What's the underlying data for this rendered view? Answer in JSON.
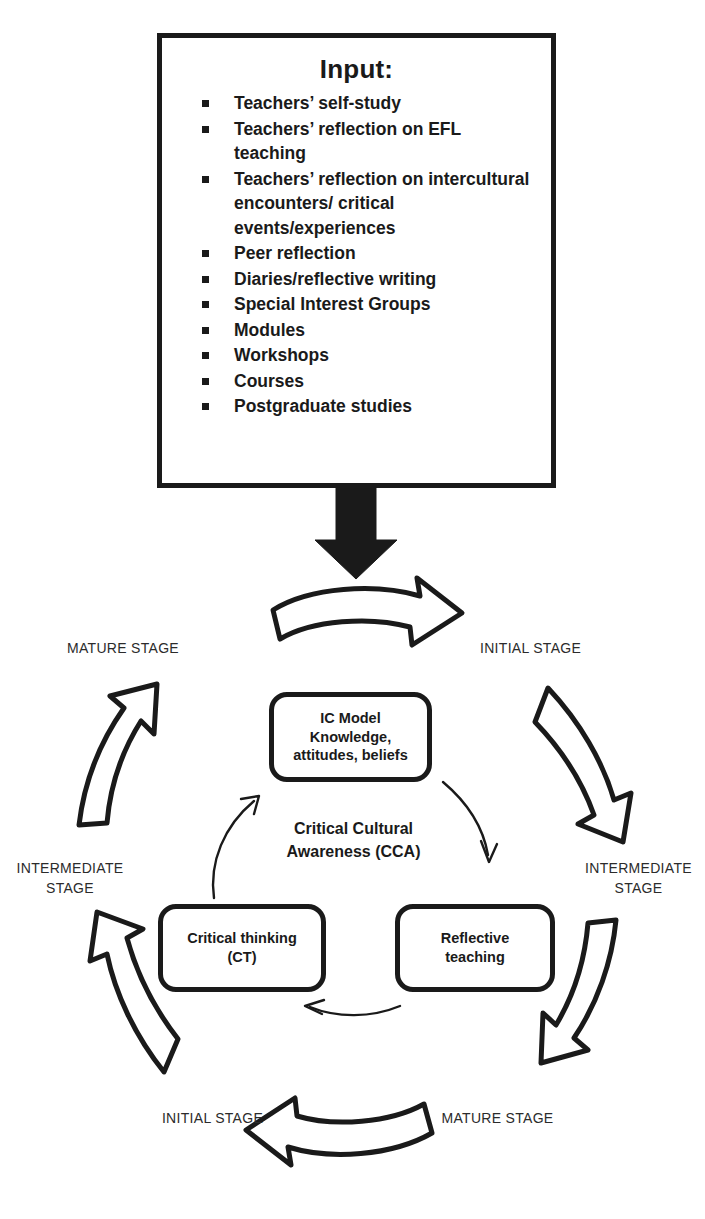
{
  "input_box": {
    "title": "Input:",
    "items": [
      "Teachers’ self-study",
      "Teachers’ reflection on EFL teaching",
      "Teachers’ reflection on intercultural encounters/ critical events/experiences",
      "Peer reflection",
      "Diaries/reflective writing",
      "Special Interest Groups",
      "Modules",
      "Workshops",
      "Courses",
      "Postgraduate studies"
    ]
  },
  "cycle": {
    "center_label": "Critical Cultural\nAwareness (CCA)",
    "nodes": [
      {
        "id": "ic-model",
        "text": "IC Model\nKnowledge,\nattitudes, beliefs"
      },
      {
        "id": "critical-thinking",
        "text": "Critical thinking\n(CT)"
      },
      {
        "id": "reflective-teaching",
        "text": "Reflective\nteaching"
      }
    ]
  },
  "stages": {
    "top_left": "MATURE STAGE",
    "top_right": "INITIAL STAGE",
    "left": "INTERMEDIATE\nSTAGE",
    "right": "INTERMEDIATE\nSTAGE",
    "bottom_left": "INITIAL STAGE",
    "bottom_right": "MATURE STAGE"
  },
  "colors": {
    "stroke": "#1a1a1a",
    "fill": "#ffffff",
    "text": "#1a1a1a",
    "stage_text": "#2b2b2b"
  },
  "icons": {
    "input_feed_arrow": "solid-down-arrow-icon",
    "cycle_arrow_top": "hollow-curved-right-arrow-icon",
    "cycle_arrow_right_upper": "hollow-curved-down-right-arrow-icon",
    "cycle_arrow_right_lower": "hollow-curved-down-left-arrow-icon",
    "cycle_arrow_bottom": "hollow-curved-left-arrow-icon",
    "cycle_arrow_left_lower": "hollow-curved-up-left-arrow-icon",
    "cycle_arrow_left_upper": "hollow-curved-up-right-arrow-icon",
    "inner_arrow_ic_to_rt": "thin-curved-arrow-icon",
    "inner_arrow_rt_to_ct": "thin-curved-arrow-icon",
    "inner_arrow_ct_to_ic": "thin-curved-arrow-icon"
  }
}
